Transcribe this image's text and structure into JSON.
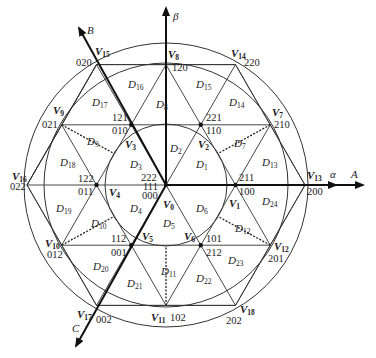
{
  "axes": {
    "alpha": "α",
    "beta": "β",
    "A": "A",
    "B": "B",
    "C": "C"
  },
  "vectors": {
    "V0": {
      "name": "V",
      "sub": "0",
      "codes": [
        "222",
        "111",
        "000"
      ]
    },
    "V1": {
      "name": "V",
      "sub": "1",
      "codes": [
        "211",
        "100"
      ]
    },
    "V2": {
      "name": "V",
      "sub": "2",
      "codes": [
        "221",
        "110"
      ]
    },
    "V3": {
      "name": "V",
      "sub": "3",
      "codes": [
        "121",
        "010"
      ]
    },
    "V4": {
      "name": "V",
      "sub": "4",
      "codes": [
        "122",
        "011"
      ]
    },
    "V5": {
      "name": "V",
      "sub": "5",
      "codes": [
        "112",
        "001"
      ]
    },
    "V6": {
      "name": "V",
      "sub": "6",
      "codes": [
        "101",
        "212"
      ]
    },
    "V7": {
      "name": "V",
      "sub": "7",
      "codes": [
        "210"
      ]
    },
    "V8": {
      "name": "V",
      "sub": "8",
      "codes": [
        "120"
      ]
    },
    "V9": {
      "name": "V",
      "sub": "9",
      "codes": [
        "021"
      ]
    },
    "V10": {
      "name": "V",
      "sub": "10",
      "codes": [
        "012"
      ]
    },
    "V11": {
      "name": "V",
      "sub": "11",
      "codes": [
        "102"
      ]
    },
    "V12": {
      "name": "V",
      "sub": "12",
      "codes": [
        "201"
      ]
    },
    "V13": {
      "name": "V",
      "sub": "13",
      "codes": [
        "200"
      ]
    },
    "V14": {
      "name": "V",
      "sub": "14",
      "codes": [
        "220"
      ]
    },
    "V15": {
      "name": "V",
      "sub": "15",
      "codes": [
        "020"
      ]
    },
    "V16": {
      "name": "V",
      "sub": "16",
      "codes": [
        "022"
      ]
    },
    "V17": {
      "name": "V",
      "sub": "17",
      "codes": [
        "002"
      ]
    },
    "V18": {
      "name": "V",
      "sub": "18",
      "codes": [
        "202"
      ]
    }
  },
  "regions": [
    {
      "id": "D1",
      "name": "D",
      "sub": "1"
    },
    {
      "id": "D2",
      "name": "D",
      "sub": "2"
    },
    {
      "id": "D3",
      "name": "D",
      "sub": "3"
    },
    {
      "id": "D4",
      "name": "D",
      "sub": "4"
    },
    {
      "id": "D5",
      "name": "D",
      "sub": "5"
    },
    {
      "id": "D6",
      "name": "D",
      "sub": "6"
    },
    {
      "id": "D7",
      "name": "D",
      "sub": "7"
    },
    {
      "id": "D8",
      "name": "D",
      "sub": "8"
    },
    {
      "id": "D9",
      "name": "D",
      "sub": "9"
    },
    {
      "id": "D10",
      "name": "D",
      "sub": "10"
    },
    {
      "id": "D11",
      "name": "D",
      "sub": "11"
    },
    {
      "id": "D12",
      "name": "D",
      "sub": "12"
    },
    {
      "id": "D13",
      "name": "D",
      "sub": "13"
    },
    {
      "id": "D14",
      "name": "D",
      "sub": "14"
    },
    {
      "id": "D15",
      "name": "D",
      "sub": "15"
    },
    {
      "id": "D16",
      "name": "D",
      "sub": "16"
    },
    {
      "id": "D17",
      "name": "D",
      "sub": "17"
    },
    {
      "id": "D18",
      "name": "D",
      "sub": "18"
    },
    {
      "id": "D19",
      "name": "D",
      "sub": "19"
    },
    {
      "id": "D20",
      "name": "D",
      "sub": "20"
    },
    {
      "id": "D21",
      "name": "D",
      "sub": "21"
    },
    {
      "id": "D22",
      "name": "D",
      "sub": "22"
    },
    {
      "id": "D23",
      "name": "D",
      "sub": "23"
    },
    {
      "id": "D24",
      "name": "D",
      "sub": "24"
    }
  ],
  "colors": {
    "line": "#222222",
    "background": "#ffffff"
  }
}
